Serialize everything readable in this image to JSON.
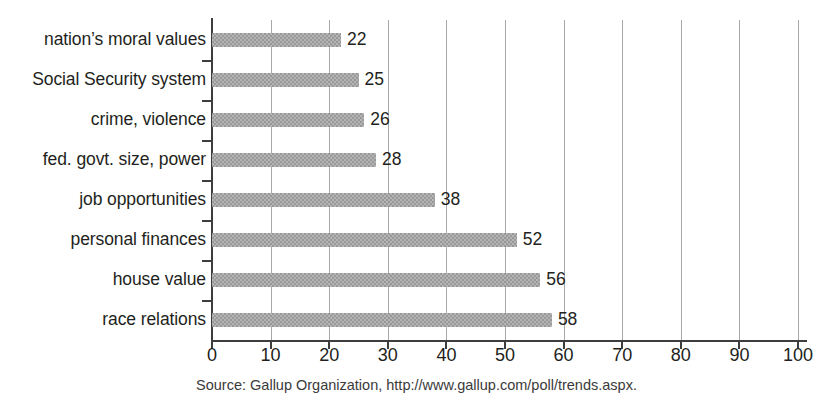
{
  "chart_data": {
    "type": "bar",
    "orientation": "horizontal",
    "title": "",
    "subtitle": "",
    "xlabel": "",
    "ylabel": "",
    "xlim": [
      0,
      100
    ],
    "xticks": [
      0,
      10,
      20,
      30,
      40,
      50,
      60,
      70,
      80,
      90,
      100
    ],
    "xtick_labels": [
      "0",
      "10",
      "20",
      "30",
      "40",
      "50",
      "60",
      "70",
      "80",
      "90",
      "100"
    ],
    "grid": "vertical",
    "legend": null,
    "bar_color": "#989898",
    "axis_color": "#3d3d3d",
    "grid_color": "#a7a7a7",
    "text_color": "#231f20",
    "categories": [
      "nation’s moral values",
      "Social Security system",
      "crime, violence",
      "fed. govt. size, power",
      "job opportunities",
      "personal finances",
      "house value",
      "race relations"
    ],
    "values": [
      22,
      25,
      26,
      28,
      38,
      52,
      56,
      58
    ],
    "value_labels": [
      "22",
      "25",
      "26",
      "28",
      "38",
      "52",
      "56",
      "58"
    ],
    "annotations": []
  },
  "caption": {
    "source_text": "Source: Gallup Organization, http://www.gallup.com/poll/trends.aspx."
  }
}
